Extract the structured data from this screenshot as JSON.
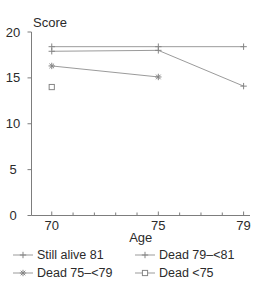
{
  "figure": {
    "background": "#ffffff"
  },
  "chart_data": {
    "type": "line",
    "title": "",
    "ylabel": "Score",
    "xlabel": "Age",
    "xlim": [
      69.05,
      79.3
    ],
    "ylim": [
      0,
      20
    ],
    "y_ticks": [
      0,
      5,
      10,
      15,
      20
    ],
    "x_major_ticks": [
      70,
      75,
      79
    ],
    "x_minor_ticks": [
      71,
      72,
      73,
      74,
      76,
      77,
      78
    ],
    "grid": false,
    "legend_position": "bottom",
    "colors": {
      "line": "#9b9b9b",
      "marker": "#858585",
      "axis": "#7d7d7d",
      "text": "#2b2b2b"
    },
    "series": [
      {
        "name": "Still alive 81",
        "marker": "plus",
        "x": [
          70,
          75,
          79
        ],
        "y": [
          18.4,
          18.4,
          18.4
        ]
      },
      {
        "name": "Dead 79–<81",
        "marker": "plus",
        "x": [
          70,
          75,
          79
        ],
        "y": [
          17.9,
          18.0,
          14.1
        ]
      },
      {
        "name": "Dead 75–<79",
        "marker": "asterisk",
        "x": [
          70,
          75
        ],
        "y": [
          16.3,
          15.1
        ]
      },
      {
        "name": "Dead <75",
        "marker": "square",
        "x": [
          70
        ],
        "y": [
          14.0
        ]
      }
    ]
  }
}
